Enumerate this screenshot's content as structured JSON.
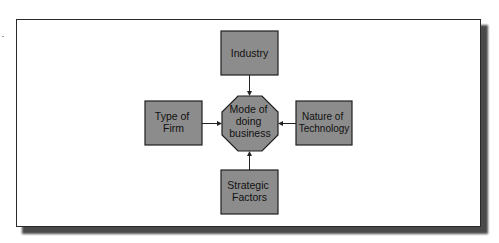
{
  "diagram": {
    "type": "influence-diagram",
    "center": {
      "id": "mode",
      "shape": "octagon",
      "lines": [
        "Mode of",
        "doing",
        "business"
      ]
    },
    "nodes": [
      {
        "id": "industry",
        "position": "top",
        "lines": [
          "Industry"
        ]
      },
      {
        "id": "type-of-firm",
        "position": "left",
        "lines": [
          "Type of",
          "Firm"
        ]
      },
      {
        "id": "nature-of-technology",
        "position": "right",
        "lines": [
          "Nature of",
          "Technology"
        ]
      },
      {
        "id": "strategic-factors",
        "position": "bottom",
        "lines": [
          "Strategic",
          "Factors"
        ]
      }
    ],
    "edges": [
      {
        "from": "industry",
        "to": "mode"
      },
      {
        "from": "type-of-firm",
        "to": "mode"
      },
      {
        "from": "nature-of-technology",
        "to": "mode"
      },
      {
        "from": "strategic-factors",
        "to": "mode"
      }
    ],
    "colors": {
      "node_fill": "#8c8c8c",
      "node_stroke": "#1e1e1e",
      "text": "#111111",
      "frame_border": "#2a2a2a",
      "shadow": "#4a4a4a"
    }
  }
}
